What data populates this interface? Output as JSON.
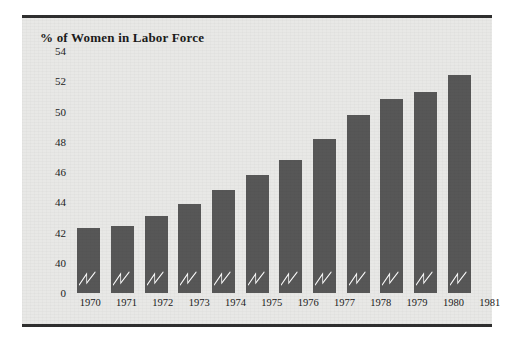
{
  "figure": {
    "title": "% of Women in Labor Force",
    "background_color": "#e8e8e6",
    "rule_color": "#2f2f2f",
    "bar_color": "#575757",
    "break_mark_color": "#ffffff",
    "break_mark_name": "axis-break-zigzag"
  },
  "chart_data": {
    "type": "bar",
    "title": "% of Women in Labor Force",
    "xlabel": "",
    "ylabel": "% of Women in Labor Force",
    "categories": [
      "1970",
      "1971",
      "1972",
      "1973",
      "1974",
      "1975",
      "1976",
      "1977",
      "1978",
      "1979",
      "1980",
      "1981"
    ],
    "values": [
      42.3,
      42.4,
      43.1,
      43.9,
      44.8,
      45.8,
      46.8,
      48.2,
      49.8,
      50.8,
      51.3,
      52.4
    ],
    "ytick_labels": [
      "54",
      "52",
      "50",
      "48",
      "46",
      "44",
      "42",
      "40",
      "0"
    ],
    "ytick_values": [
      54,
      52,
      50,
      48,
      46,
      44,
      42,
      40,
      0
    ],
    "ylim": [
      40,
      55
    ],
    "y_axis_broken": true,
    "y_break_between": [
      0,
      40
    ],
    "grid": false,
    "legend": null,
    "series": [
      {
        "name": "% of Women in Labor Force",
        "values": [
          42.3,
          42.4,
          43.1,
          43.9,
          44.8,
          45.8,
          46.8,
          48.2,
          49.8,
          50.8,
          51.3,
          52.4
        ]
      }
    ]
  }
}
